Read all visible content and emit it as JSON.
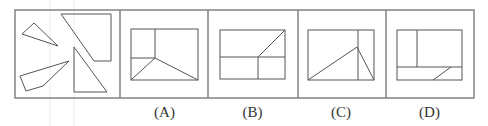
{
  "figure": {
    "type": "spatial-reasoning-puzzle",
    "pieces_panel": {
      "pieces": [
        {
          "name": "small-triangle",
          "points": [
            [
              22,
              34
            ],
            [
              34,
              23
            ],
            [
              58,
              46
            ]
          ]
        },
        {
          "name": "quadrilateral-top-right",
          "points": [
            [
              61,
              14
            ],
            [
              111,
              14
            ],
            [
              111,
              61
            ],
            [
              94,
              61
            ]
          ]
        },
        {
          "name": "quadrilateral-bottom-left",
          "points": [
            [
              20,
              76
            ],
            [
              69,
              61
            ],
            [
              43,
              86
            ],
            [
              26,
              91
            ]
          ]
        },
        {
          "name": "right-triangle",
          "points": [
            [
              74,
              47
            ],
            [
              74,
              92
            ],
            [
              107,
              92
            ]
          ]
        }
      ]
    },
    "options": [
      {
        "label": "(A)",
        "rect": [
          131,
          29,
          198,
          80
        ],
        "lines": [
          [
            155,
            29,
            155,
            58
          ],
          [
            131,
            58,
            155,
            58
          ],
          [
            155,
            58,
            131,
            80
          ],
          [
            155,
            58,
            198,
            80
          ]
        ]
      },
      {
        "label": "(B)",
        "rect": [
          220,
          30,
          285,
          79
        ],
        "lines": [
          [
            220,
            57,
            285,
            57
          ],
          [
            258,
            57,
            258,
            79
          ],
          [
            258,
            57,
            285,
            30
          ]
        ]
      },
      {
        "label": "(C)",
        "rect": [
          308,
          30,
          374,
          80
        ],
        "lines": [
          [
            358,
            30,
            358,
            80
          ],
          [
            308,
            80,
            357,
            47
          ],
          [
            357,
            47,
            374,
            80
          ]
        ]
      },
      {
        "label": "(D)",
        "rect": [
          397,
          30,
          462,
          80
        ],
        "lines": [
          [
            397,
            67,
            462,
            67
          ],
          [
            417,
            30,
            417,
            67
          ],
          [
            433,
            80,
            451,
            67
          ]
        ]
      }
    ]
  }
}
